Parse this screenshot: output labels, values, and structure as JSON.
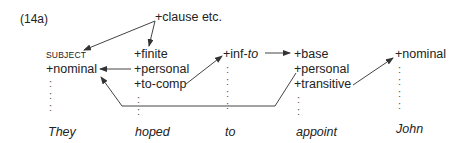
{
  "example_label": "(14a)",
  "root": "+clause etc.",
  "columns": [
    {
      "id": "they",
      "header": "SUBJECT",
      "features": [
        "+nominal"
      ],
      "word": "They"
    },
    {
      "id": "hoped",
      "features": [
        "+finite",
        "+personal",
        "+to-comp"
      ],
      "word": "hoped"
    },
    {
      "id": "to",
      "features_prefix": "+inf-",
      "features_italic": "to",
      "word": "to"
    },
    {
      "id": "appoint",
      "features": [
        "+base",
        "+personal",
        "+transitive"
      ],
      "word": "appoint"
    },
    {
      "id": "john",
      "features": [
        "+nominal"
      ],
      "word": "John"
    }
  ],
  "dot": ":"
}
